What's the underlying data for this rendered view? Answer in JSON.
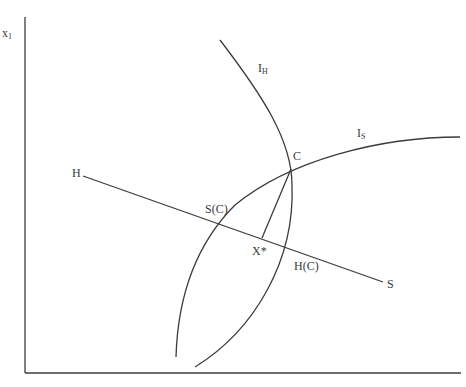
{
  "figure": {
    "axes": {
      "y_label_main": "x",
      "y_label_sub": "1",
      "x_label": ""
    },
    "curves": {
      "IH": {
        "label_main": "I",
        "label_sub": "H"
      },
      "IS": {
        "label_main": "I",
        "label_sub": "S"
      }
    },
    "line_HS": {
      "start_label": "H",
      "end_label": "S"
    },
    "points": {
      "C": "C",
      "SC": "S(C)",
      "HC": "H(C)",
      "Xstar": "X*"
    },
    "colors": {
      "line": "#3c3c3c",
      "text": "#3a3a3a",
      "background": "#ffffff"
    }
  }
}
